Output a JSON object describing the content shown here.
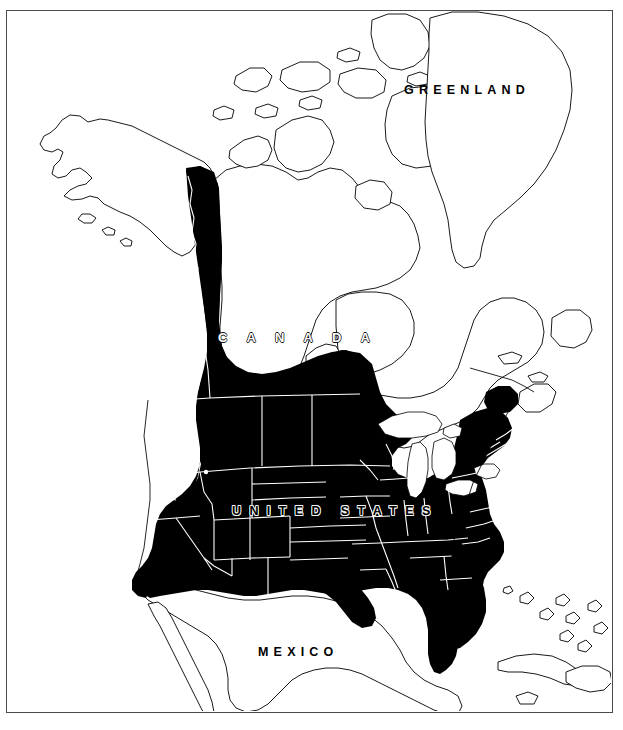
{
  "map": {
    "title": "North America distribution range map",
    "projection": "conic",
    "frame": {
      "stroke": "#4a4a4a",
      "width": 607,
      "height": 703,
      "left": 6,
      "top": 10
    },
    "background_color": "#ffffff",
    "coastline_color": "#000000",
    "shaded_color": "#000000",
    "unshaded_color": "#ffffff",
    "internal_border_color": "#ffffff",
    "legend_note": "Solid black fill indicates the mapped distribution range",
    "labels": [
      {
        "id": "greenland",
        "text": "GREENLAND",
        "style": "black-on-white",
        "x": 404,
        "y": 83
      },
      {
        "id": "canada",
        "text": "C A N A D A",
        "style": "white-outline",
        "x": 218,
        "y": 330
      },
      {
        "id": "united_states",
        "text": "UNITED STATES",
        "style": "white-outline-on-black",
        "x": 232,
        "y": 504
      },
      {
        "id": "mexico",
        "text": "MEXICO",
        "style": "black-on-white",
        "x": 258,
        "y": 645
      }
    ],
    "regions": [
      {
        "name": "Alaska",
        "country": "United States",
        "shaded": false
      },
      {
        "name": "Yukon",
        "country": "Canada",
        "shaded": true
      },
      {
        "name": "British Columbia",
        "country": "Canada",
        "shaded": true
      },
      {
        "name": "Alberta",
        "country": "Canada",
        "shaded": true
      },
      {
        "name": "Saskatchewan",
        "country": "Canada",
        "shaded": true
      },
      {
        "name": "Manitoba",
        "country": "Canada",
        "shaded": true
      },
      {
        "name": "Northwest Territories",
        "country": "Canada",
        "shaded": false
      },
      {
        "name": "Nunavut",
        "country": "Canada",
        "shaded": false
      },
      {
        "name": "Ontario",
        "country": "Canada",
        "shaded": false
      },
      {
        "name": "Quebec",
        "country": "Canada",
        "shaded": false
      },
      {
        "name": "Newfoundland and Labrador",
        "country": "Canada",
        "shaded": false
      },
      {
        "name": "Contiguous United States",
        "country": "United States",
        "shaded": true
      },
      {
        "name": "Great Lakes",
        "country": "United States",
        "shaded": false
      },
      {
        "name": "Hudson Bay",
        "country": "Canada",
        "shaded": false
      },
      {
        "name": "Greenland",
        "country": "Denmark",
        "shaded": false
      },
      {
        "name": "Mexico",
        "country": "Mexico",
        "shaded": false
      },
      {
        "name": "Cuba",
        "country": "Cuba",
        "shaded": false
      },
      {
        "name": "Hispaniola",
        "country": "Hispaniola",
        "shaded": false
      },
      {
        "name": "Bahamas",
        "country": "Bahamas",
        "shaded": false
      }
    ]
  }
}
